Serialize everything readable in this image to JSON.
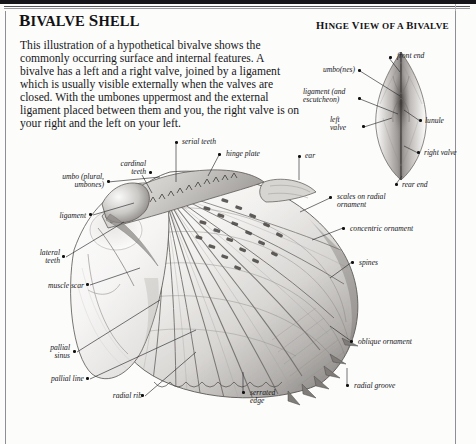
{
  "page": {
    "title_caps": "B",
    "title_rest": "IVALVE ",
    "title_caps2": "S",
    "title_rest2": "HELL",
    "title_full": "BIVALVE SHELL",
    "intro": "This illustration of a hypothetical bivalve shows the commonly occurring surface and internal features. A bivalve has a left and a right valve, joined by a ligament which is usually visible externally when the valves are closed. With the umbones uppermost and the external ligament placed between them and you, the right valve is on your right and the left on your left.",
    "subtitle_full": "HINGE VIEW OF A BIVALVE"
  },
  "colors": {
    "ink": "#16161a",
    "rule": "#8e8e94",
    "paper": "#fcfcfa",
    "shell_light": "#f4f3f1",
    "shell_mid": "#c9c7c4",
    "shell_dark": "#6f6d6b"
  },
  "hinge_labels": {
    "front_end": "front end",
    "umbo": "umbo(nes)",
    "ligament_escutcheon_l1": "ligament (and",
    "ligament_escutcheon_l2": "escutcheon)",
    "left_valve_l1": "left",
    "left_valve_l2": "valve",
    "lunule": "lunule",
    "right_valve": "right valve",
    "rear_end": "rear end"
  },
  "shell_labels": {
    "serial_teeth": "serial teeth",
    "hinge_plate": "hinge plate",
    "ear": "ear",
    "cardinal_teeth_l1": "cardinal",
    "cardinal_teeth_l2": "teeth",
    "umbo_l1": "umbo (plural,",
    "umbo_l2": "umbones)",
    "ligament": "ligament",
    "lateral_teeth_l1": "lateral",
    "lateral_teeth_l2": "teeth",
    "muscle_scar": "muscle scar",
    "pallial_sinus_l1": "pallial",
    "pallial_sinus_l2": "sinus",
    "pallial_line": "pallial line",
    "radial_rib": "radial rib",
    "serrated_edge_l1": "serrated",
    "serrated_edge_l2": "edge",
    "radial_groove": "radial groove",
    "scales_l1": "scales on radial",
    "scales_l2": "ornament",
    "concentric_ornament": "concentric ornament",
    "spines": "spines",
    "oblique_ornament": "oblique ornament"
  }
}
